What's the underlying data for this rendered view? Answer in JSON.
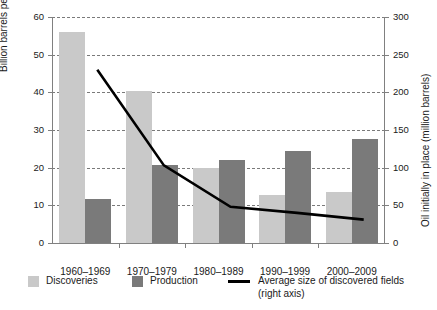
{
  "title_cropped": "Oil discoveries, production and average field size",
  "axes": {
    "left": {
      "label": "Billion barrels per year",
      "ticks": [
        "0",
        "10",
        "20",
        "30",
        "40",
        "50",
        "60"
      ],
      "min": 0,
      "max": 60
    },
    "right": {
      "label": "Oil initially in place (million barrels)",
      "ticks": [
        "0",
        "50",
        "100",
        "150",
        "200",
        "250",
        "300"
      ],
      "min": 0,
      "max": 300
    }
  },
  "categories": [
    "1960–1969",
    "1970–1979",
    "1980–1989",
    "1990–1999",
    "2000–2009"
  ],
  "legend": {
    "discoveries_label": "Discoveries",
    "production_label": "Production",
    "line_label": "Average size of discovered fields",
    "line_label_2": "(right axis)"
  },
  "colors": {
    "discoveries": "#c9c9c9",
    "production": "#7a7a7a",
    "line": "#000000",
    "grid": "#7a7a7a",
    "axis": "#808080",
    "text": "#1a1a1a"
  },
  "chart_data": {
    "type": "bar",
    "title": "Oil discoveries, production and average field size",
    "xlabel": "",
    "ylabel": "Billion barrels per year",
    "y2label": "Oil initially in place (million barrels)",
    "ylim": [
      0,
      60
    ],
    "y2lim": [
      0,
      300
    ],
    "grid": true,
    "legend_position": "bottom",
    "categories": [
      "1960–1969",
      "1970–1979",
      "1980–1989",
      "1990–1999",
      "2000–2009"
    ],
    "series": [
      {
        "name": "Discoveries",
        "type": "bar",
        "axis": "left",
        "unit": "billion barrels per year",
        "color": "#c9c9c9",
        "values": [
          56.0,
          40.3,
          19.8,
          12.7,
          13.5
        ]
      },
      {
        "name": "Production",
        "type": "bar",
        "axis": "left",
        "unit": "billion barrels per year",
        "color": "#7a7a7a",
        "values": [
          11.8,
          20.8,
          22.0,
          24.5,
          27.7
        ]
      },
      {
        "name": "Average size of discovered fields (right axis)",
        "type": "line",
        "axis": "right",
        "unit": "million barrels",
        "color": "#000000",
        "values": [
          230,
          103,
          48,
          40,
          31
        ]
      }
    ]
  }
}
